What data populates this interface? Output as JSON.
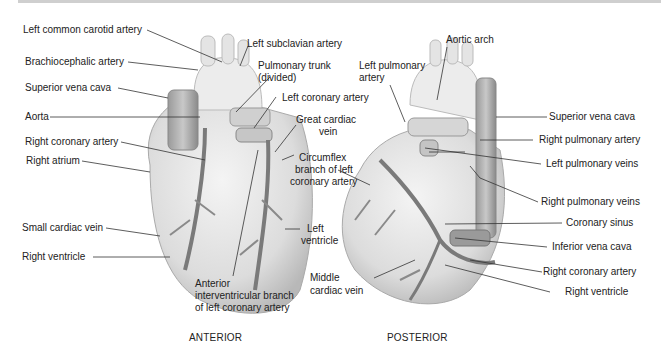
{
  "figure": {
    "views": [
      {
        "caption": "ANTERIOR",
        "labels": [
          "Left common carotid artery",
          "Brachiocephalic artery",
          "Superior vena cava",
          "Aorta",
          "Right coronary artery",
          "Right atrium",
          "Small cardiac vein",
          "Right ventricle",
          "Left subclavian artery",
          "Pulmonary trunk",
          "(divided)",
          "Left coronary artery",
          "Great cardiac",
          "vein",
          "Circumflex",
          "branch of left",
          "coronary artery",
          "Left",
          "ventricle",
          "Anterior",
          "interventricular branch",
          "of left coronary artery"
        ]
      },
      {
        "caption": "POSTERIOR",
        "labels": [
          "Left pulmonary",
          "artery",
          "Aortic arch",
          "Superior vena cava",
          "Right pulmonary artery",
          "Left pulmonary veins",
          "Right pulmonary veins",
          "Coronary sinus",
          "Inferior vena cava",
          "Right coronary artery",
          "Right ventricle",
          "Middle",
          "cardiac vein"
        ]
      }
    ]
  }
}
